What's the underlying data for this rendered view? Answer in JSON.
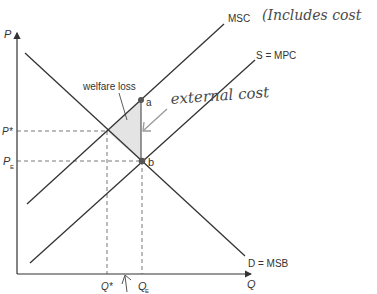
{
  "diagram": {
    "type": "negative-externality-supply-demand",
    "axes": {
      "y_label": "P",
      "x_label": "Q",
      "y_ticks": [
        {
          "label": "P*",
          "sub": ""
        },
        {
          "label": "P",
          "sub": "E"
        }
      ],
      "x_ticks": [
        {
          "label": "Q*",
          "sub": ""
        },
        {
          "label": "Q",
          "sub": "E"
        }
      ]
    },
    "curves": {
      "msc": "MSC",
      "mpc": "S = MPC",
      "msb": "D = MSB"
    },
    "points": {
      "a": "a",
      "b": "b"
    },
    "annotations": {
      "welfare_loss": "welfare loss",
      "handwritten_includes": "(Includes cost",
      "handwritten_external": "external cost"
    },
    "colors": {
      "line": "#333333",
      "shade": "#e4e4e4",
      "handwriting": "#4a4a4a",
      "arrow": "#999999"
    }
  }
}
